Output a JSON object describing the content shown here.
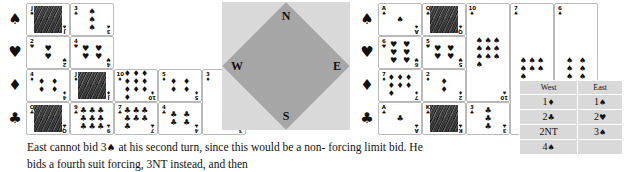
{
  "figure": {
    "suit_symbols": [
      "♠",
      "♥",
      "♦",
      "♣"
    ],
    "suit_names": [
      "spade-suit",
      "heart-suit",
      "diamond-suit",
      "club-suit"
    ]
  },
  "compass": {
    "north": "N",
    "south": "S",
    "west": "W",
    "east": "E",
    "square_color": "#d9d9d9",
    "diamond_color": "#a6a6a6"
  },
  "hands": {
    "west": {
      "label": "West",
      "spades": [
        {
          "rank": "J",
          "suit": "♠",
          "court": true
        },
        {
          "rank": "3",
          "suit": "♠",
          "court": false
        }
      ],
      "hearts": [
        {
          "rank": "2",
          "suit": "♥",
          "court": false
        },
        {
          "rank": "4",
          "suit": "♥",
          "court": false
        }
      ],
      "diamonds": [
        {
          "rank": "4",
          "suit": "♦",
          "court": false
        },
        {
          "rank": "J",
          "suit": "♦",
          "court": true
        },
        {
          "rank": "10",
          "suit": "♦",
          "court": false
        },
        {
          "rank": "5",
          "suit": "♦",
          "court": false
        },
        {
          "rank": "3",
          "suit": "♦",
          "court": false
        }
      ],
      "clubs": [
        {
          "rank": "Q",
          "suit": "♣",
          "court": true
        },
        {
          "rank": "9",
          "suit": "♣",
          "court": false
        },
        {
          "rank": "7",
          "suit": "♣",
          "court": false
        },
        {
          "rank": "4",
          "suit": "♣",
          "court": false
        }
      ]
    },
    "east": {
      "label": "East",
      "spades": [
        {
          "rank": "A",
          "suit": "♠",
          "court": false
        },
        {
          "rank": "Q",
          "suit": "♠",
          "court": true
        },
        {
          "rank": "10",
          "suit": "♠",
          "court": false
        },
        {
          "rank": "7",
          "suit": "♠",
          "court": false
        },
        {
          "rank": "6",
          "suit": "♠",
          "court": false
        }
      ],
      "hearts": [
        {
          "rank": "6",
          "suit": "♥",
          "court": false
        },
        {
          "rank": "5",
          "suit": "♥",
          "court": false
        }
      ],
      "diamonds": [
        {
          "rank": "7",
          "suit": "♦",
          "court": false
        },
        {
          "rank": "2",
          "suit": "♦",
          "court": false
        }
      ],
      "clubs": [
        {
          "rank": "A",
          "suit": "♣",
          "court": false
        },
        {
          "rank": "K",
          "suit": "♣",
          "court": true
        },
        {
          "rank": "3",
          "suit": "♣",
          "court": false
        }
      ]
    }
  },
  "bidding": {
    "headers": [
      "West",
      "East"
    ],
    "rows": [
      {
        "west_level": "1",
        "west_suit": "♦",
        "east_level": "1",
        "east_suit": "♠"
      },
      {
        "west_level": "2",
        "west_suit": "♣",
        "east_level": "2",
        "east_suit": "♥"
      },
      {
        "west_level": "2NT",
        "west_suit": "",
        "east_level": "3",
        "east_suit": "♠"
      },
      {
        "west_level": "4",
        "west_suit": "♠",
        "east_level": "",
        "east_suit": ""
      }
    ]
  },
  "caption": {
    "line1_a": "East cannot bid 3",
    "line1_suit": "♠",
    "line1_b": " at his second turn, since this would be a non-",
    "line2": "forcing limit bid. He bids a fourth suit forcing, 3NT instead, and then"
  }
}
